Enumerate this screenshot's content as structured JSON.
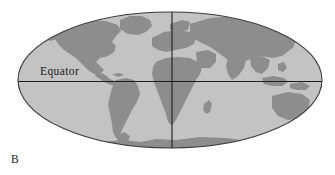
{
  "figure": {
    "panel_label": "B",
    "background_color": "#ffffff"
  },
  "map": {
    "projection": "mollweide-ellipse",
    "ocean_color": "#c3c3c3",
    "land_color": "#8d8d8d",
    "outline_color": "#3a3a3a",
    "graticule_color": "#1c1c1c",
    "ellipse": {
      "center_x": 170,
      "center_y": 80,
      "radius_x": 152,
      "radius_y": 68
    },
    "labels": {
      "equator": "Equator"
    },
    "graticule": {
      "equator_y": 81,
      "prime_meridian_x": 172
    }
  }
}
